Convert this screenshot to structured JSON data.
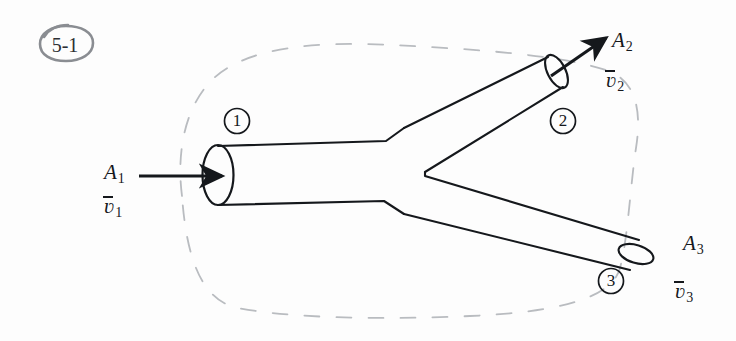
{
  "figure": {
    "problem_tag": "5-1",
    "ink_color": "#15181c",
    "tag_color": "#8a8d92",
    "boundary_color": "#b9bcc0",
    "background_color": "#fdfdfd"
  },
  "sections": [
    {
      "id": "station-1",
      "number": "1"
    },
    {
      "id": "station-2",
      "number": "2"
    },
    {
      "id": "station-3",
      "number": "3"
    }
  ],
  "labels": {
    "inlet": {
      "area": {
        "base": "A",
        "sub": "1"
      },
      "velocity": {
        "base": "ʋ",
        "sub": "1"
      }
    },
    "outlet_upper": {
      "area": {
        "base": "A",
        "sub": "2"
      },
      "velocity": {
        "base": "ʋ",
        "sub": "2"
      }
    },
    "outlet_lower": {
      "area": {
        "base": "A",
        "sub": "3"
      },
      "velocity": {
        "base": "ʋ",
        "sub": "3"
      }
    }
  }
}
